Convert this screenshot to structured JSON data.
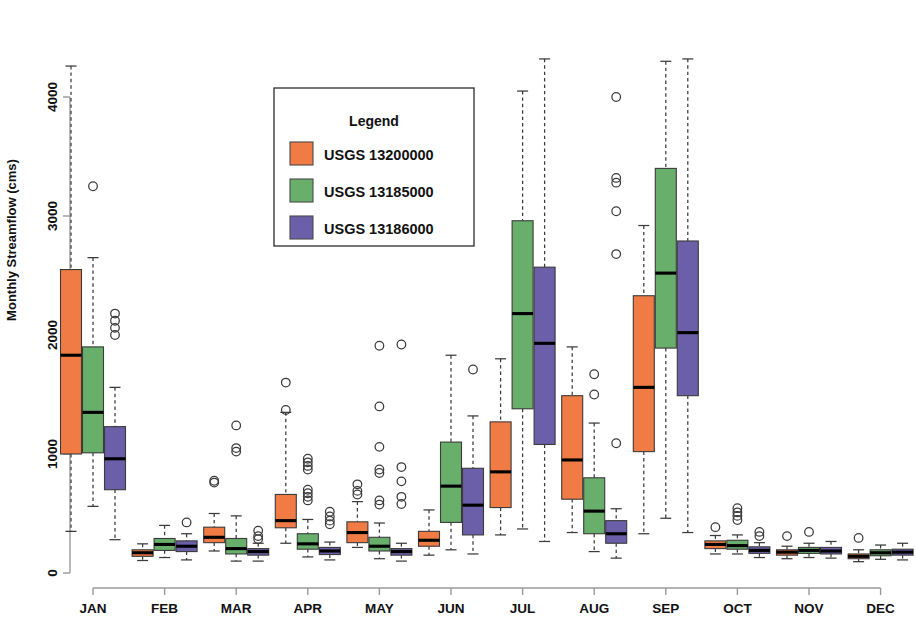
{
  "chart_data": {
    "type": "box",
    "title": "",
    "xlabel": "",
    "ylabel": "Monthly Streamflow (cms)",
    "ylim": [
      0,
      4300
    ],
    "y_ticks": [
      0,
      1000,
      2000,
      3000,
      4000
    ],
    "y_tick_labels": [
      "0",
      "1000",
      "2000",
      "3000",
      "4000"
    ],
    "grid": false,
    "categories": [
      "JAN",
      "FEB",
      "MAR",
      "APR",
      "MAY",
      "JUN",
      "JUL",
      "AUG",
      "SEP",
      "OCT",
      "NOV",
      "DEC"
    ],
    "legend": {
      "title": "Legend",
      "position": "top-center",
      "entries": [
        {
          "label": "USGS 13200000",
          "color": "#F07B45"
        },
        {
          "label": "USGS 13185000",
          "color": "#69AF6C"
        },
        {
          "label": "USGS 13186000",
          "color": "#6A5FA8"
        }
      ]
    },
    "series": [
      {
        "name": "USGS 13200000",
        "color": "#F07B45",
        "boxes": [
          {
            "category": "JAN",
            "whisker_low": 350,
            "q1": 1000,
            "median": 1830,
            "q3": 2550,
            "whisker_high": 4260,
            "outliers": []
          },
          {
            "category": "FEB",
            "whisker_low": 105,
            "q1": 140,
            "median": 170,
            "q3": 195,
            "whisker_high": 245,
            "outliers": []
          },
          {
            "category": "MAR",
            "whisker_low": 185,
            "q1": 255,
            "median": 300,
            "q3": 385,
            "whisker_high": 500,
            "outliers": [
              760,
              775
            ]
          },
          {
            "category": "APR",
            "whisker_low": 250,
            "q1": 380,
            "median": 440,
            "q3": 660,
            "whisker_high": 1350,
            "outliers": [
              1600,
              1370
            ]
          },
          {
            "category": "MAY",
            "whisker_low": 215,
            "q1": 255,
            "median": 340,
            "q3": 430,
            "whisker_high": 600,
            "outliers": [
              745,
              690,
              660
            ]
          },
          {
            "category": "JUN",
            "whisker_low": 150,
            "q1": 225,
            "median": 275,
            "q3": 350,
            "whisker_high": 530,
            "outliers": []
          },
          {
            "category": "JUL",
            "whisker_low": 320,
            "q1": 550,
            "median": 850,
            "q3": 1270,
            "whisker_high": 1800,
            "outliers": []
          },
          {
            "category": "AUG",
            "whisker_low": 340,
            "q1": 620,
            "median": 950,
            "q3": 1490,
            "whisker_high": 1900,
            "outliers": []
          },
          {
            "category": "SEP",
            "whisker_low": 330,
            "q1": 1020,
            "median": 1560,
            "q3": 2330,
            "whisker_high": 2920,
            "outliers": []
          },
          {
            "category": "OCT",
            "whisker_low": 160,
            "q1": 205,
            "median": 240,
            "q3": 270,
            "whisker_high": 315,
            "outliers": [
              385
            ]
          },
          {
            "category": "NOV",
            "whisker_low": 120,
            "q1": 150,
            "median": 175,
            "q3": 195,
            "whisker_high": 225,
            "outliers": [
              310
            ]
          },
          {
            "category": "DEC",
            "whisker_low": 95,
            "q1": 120,
            "median": 140,
            "q3": 160,
            "whisker_high": 195,
            "outliers": [
              295
            ]
          }
        ]
      },
      {
        "name": "USGS 13185000",
        "color": "#69AF6C",
        "boxes": [
          {
            "category": "JAN",
            "whisker_low": 560,
            "q1": 1010,
            "median": 1350,
            "q3": 1900,
            "whisker_high": 2650,
            "outliers": [
              3250
            ]
          },
          {
            "category": "FEB",
            "whisker_low": 130,
            "q1": 190,
            "median": 240,
            "q3": 290,
            "whisker_high": 400,
            "outliers": []
          },
          {
            "category": "MAR",
            "whisker_low": 100,
            "q1": 160,
            "median": 205,
            "q3": 290,
            "whisker_high": 480,
            "outliers": [
              1240,
              1020,
              1050
            ]
          },
          {
            "category": "APR",
            "whisker_low": 135,
            "q1": 200,
            "median": 245,
            "q3": 330,
            "whisker_high": 450,
            "outliers": [
              960,
              930,
              900,
              870,
              700,
              670,
              640,
              610
            ]
          },
          {
            "category": "MAY",
            "whisker_low": 120,
            "q1": 185,
            "median": 225,
            "q3": 300,
            "whisker_high": 420,
            "outliers": [
              1910,
              1400,
              1060,
              870,
              840,
              610,
              575
            ]
          },
          {
            "category": "JUN",
            "whisker_low": 195,
            "q1": 425,
            "median": 730,
            "q3": 1100,
            "whisker_high": 1830,
            "outliers": []
          },
          {
            "category": "JUL",
            "whisker_low": 370,
            "q1": 1380,
            "median": 2180,
            "q3": 2960,
            "whisker_high": 4050,
            "outliers": []
          },
          {
            "category": "AUG",
            "whisker_low": 180,
            "q1": 330,
            "median": 520,
            "q3": 800,
            "whisker_high": 1260,
            "outliers": [
              1500,
              1670
            ]
          },
          {
            "category": "SEP",
            "whisker_low": 460,
            "q1": 1890,
            "median": 2520,
            "q3": 3400,
            "whisker_high": 4300,
            "outliers": []
          },
          {
            "category": "OCT",
            "whisker_low": 160,
            "q1": 200,
            "median": 230,
            "q3": 275,
            "whisker_high": 320,
            "outliers": [
              445,
              480,
              510,
              545
            ]
          },
          {
            "category": "NOV",
            "whisker_low": 130,
            "q1": 165,
            "median": 190,
            "q3": 215,
            "whisker_high": 250,
            "outliers": [
              345
            ]
          },
          {
            "category": "DEC",
            "whisker_low": 115,
            "q1": 145,
            "median": 170,
            "q3": 195,
            "whisker_high": 235,
            "outliers": []
          }
        ]
      },
      {
        "name": "USGS 13186000",
        "color": "#6A5FA8",
        "boxes": [
          {
            "category": "JAN",
            "whisker_low": 280,
            "q1": 700,
            "median": 960,
            "q3": 1230,
            "whisker_high": 1560,
            "outliers": [
              2180,
              2120,
              2060,
              2000
            ]
          },
          {
            "category": "FEB",
            "whisker_low": 110,
            "q1": 180,
            "median": 225,
            "q3": 270,
            "whisker_high": 330,
            "outliers": [
              425
            ]
          },
          {
            "category": "MAR",
            "whisker_low": 100,
            "q1": 150,
            "median": 180,
            "q3": 205,
            "whisker_high": 250,
            "outliers": [
              355,
              310,
              285
            ]
          },
          {
            "category": "APR",
            "whisker_low": 110,
            "q1": 155,
            "median": 185,
            "q3": 215,
            "whisker_high": 260,
            "outliers": [
              515,
              475,
              440,
              410
            ]
          },
          {
            "category": "MAY",
            "whisker_low": 100,
            "q1": 150,
            "median": 180,
            "q3": 205,
            "whisker_high": 250,
            "outliers": [
              1920,
              890,
              770,
              640,
              580
            ]
          },
          {
            "category": "JUN",
            "whisker_low": 160,
            "q1": 320,
            "median": 570,
            "q3": 880,
            "whisker_high": 1320,
            "outliers": [
              1710
            ]
          },
          {
            "category": "JUL",
            "whisker_low": 265,
            "q1": 1080,
            "median": 1930,
            "q3": 2570,
            "whisker_high": 4320,
            "outliers": []
          },
          {
            "category": "AUG",
            "whisker_low": 125,
            "q1": 250,
            "median": 330,
            "q3": 440,
            "whisker_high": 540,
            "outliers": [
              1090,
              2680,
              3040,
              3280,
              3320,
              4000
            ]
          },
          {
            "category": "SEP",
            "whisker_low": 340,
            "q1": 1490,
            "median": 2020,
            "q3": 2790,
            "whisker_high": 4320,
            "outliers": []
          },
          {
            "category": "OCT",
            "whisker_low": 130,
            "q1": 165,
            "median": 190,
            "q3": 220,
            "whisker_high": 255,
            "outliers": [
              345,
              310
            ]
          },
          {
            "category": "NOV",
            "whisker_low": 125,
            "q1": 160,
            "median": 185,
            "q3": 215,
            "whisker_high": 265,
            "outliers": []
          },
          {
            "category": "DEC",
            "whisker_low": 110,
            "q1": 150,
            "median": 175,
            "q3": 200,
            "whisker_high": 250,
            "outliers": []
          }
        ]
      }
    ]
  }
}
